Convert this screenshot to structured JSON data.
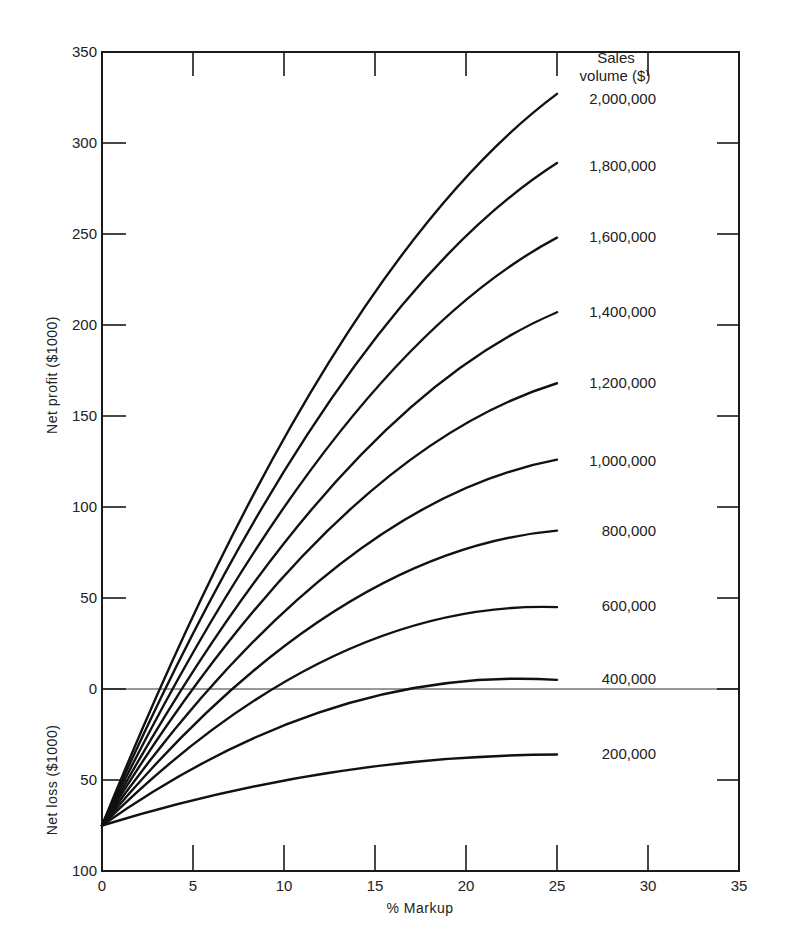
{
  "chart_data": {
    "type": "line",
    "title": "",
    "xlabel": "% Markup",
    "ylabel_top": "Net profit ($1000)",
    "ylabel_bottom": "Net loss ($1000)",
    "legend_title": [
      "Sales",
      "volume ($)"
    ],
    "xlim": [
      0,
      35
    ],
    "ylim": [
      -100,
      350
    ],
    "x_ticks": [
      0,
      5,
      10,
      15,
      20,
      25,
      30,
      35
    ],
    "y_ticks": [
      {
        "value": 350,
        "label": "350"
      },
      {
        "value": 300,
        "label": "300"
      },
      {
        "value": 250,
        "label": "250"
      },
      {
        "value": 200,
        "label": "200"
      },
      {
        "value": 150,
        "label": "150"
      },
      {
        "value": 100,
        "label": "100"
      },
      {
        "value": 50,
        "label": "50"
      },
      {
        "value": 0,
        "label": "0"
      },
      {
        "value": -50,
        "label": "50"
      },
      {
        "value": -100,
        "label": "100"
      }
    ],
    "grid": false,
    "zero_line": true,
    "series": [
      {
        "name": "2,000,000",
        "x": [
          0,
          12.5,
          25
        ],
        "y": [
          -75,
          180,
          327
        ],
        "breakeven_markup": 3.8
      },
      {
        "name": "1,800,000",
        "x": [
          0,
          12.5,
          25
        ],
        "y": [
          -75,
          158,
          289
        ],
        "breakeven_markup": 4.3
      },
      {
        "name": "1,600,000",
        "x": [
          0,
          12.5,
          25
        ],
        "y": [
          -75,
          134,
          248
        ],
        "breakeven_markup": 4.9
      },
      {
        "name": "1,400,000",
        "x": [
          0,
          12.5,
          25
        ],
        "y": [
          -75,
          110,
          207
        ],
        "breakeven_markup": 5.7
      },
      {
        "name": "1,200,000",
        "x": [
          0,
          12.5,
          25
        ],
        "y": [
          -75,
          88,
          168
        ],
        "breakeven_markup": 6.6
      },
      {
        "name": "1,000,000",
        "x": [
          0,
          12.5,
          25
        ],
        "y": [
          -75,
          64,
          126
        ],
        "breakeven_markup": 8.3
      },
      {
        "name": "800,000",
        "x": [
          0,
          12.5,
          25
        ],
        "y": [
          -75,
          41,
          87
        ],
        "breakeven_markup": 10.5
      },
      {
        "name": "600,000",
        "x": [
          0,
          12.5,
          25
        ],
        "y": [
          -75,
          17,
          45
        ],
        "breakeven_markup": 14.3
      },
      {
        "name": "400,000",
        "x": [
          0,
          12.5,
          25
        ],
        "y": [
          -75,
          -11,
          5
        ],
        "breakeven_markup": 24
      },
      {
        "name": "200,000",
        "x": [
          0,
          12.5,
          25
        ],
        "y": [
          -75,
          -46,
          -36
        ],
        "breakeven_markup": null
      }
    ],
    "label_y_px": [
      99,
      166,
      237,
      312,
      383,
      461,
      531,
      606,
      679,
      754
    ]
  }
}
